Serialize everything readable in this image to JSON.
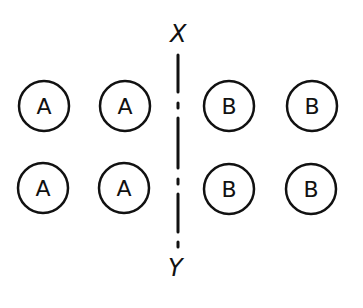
{
  "diagram": {
    "axis": {
      "top_label": "X",
      "bottom_label": "Y",
      "style": "dash-dot"
    },
    "group_a": {
      "label": "A",
      "circles": [
        {
          "label": "A",
          "cx": 44,
          "cy": 106
        },
        {
          "label": "A",
          "cx": 125,
          "cy": 106
        },
        {
          "label": "A",
          "cx": 43,
          "cy": 188
        },
        {
          "label": "A",
          "cx": 124,
          "cy": 188
        }
      ]
    },
    "group_b": {
      "label": "B",
      "circles": [
        {
          "label": "B",
          "cx": 229,
          "cy": 106
        },
        {
          "label": "B",
          "cx": 312,
          "cy": 106
        },
        {
          "label": "B",
          "cx": 229,
          "cy": 189
        },
        {
          "label": "B",
          "cx": 311,
          "cy": 189
        }
      ]
    },
    "colors": {
      "stroke": "#111111",
      "background": "#ffffff"
    }
  }
}
